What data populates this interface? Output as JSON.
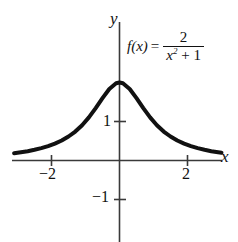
{
  "figure": {
    "kind": "function-graph",
    "background_color": "#ffffff",
    "curve_color": "#111111",
    "axis_color": "#3a3a3a"
  },
  "formula": {
    "function_name": "f(x)",
    "equals": "=",
    "numerator": "2",
    "denominator_variable": "x",
    "denominator_exponent": "2",
    "denominator_rest": "+ 1",
    "plain": "f(x) = 2 / (x^2 + 1)"
  },
  "axes": {
    "x_label": "x",
    "y_label": "y",
    "x_ticks": [
      {
        "value": -2,
        "label": "−2"
      },
      {
        "value": 2,
        "label": "2"
      }
    ],
    "y_ticks": [
      {
        "value": 1,
        "label": "1"
      },
      {
        "value": -1,
        "label": "−1"
      }
    ]
  },
  "chart_data": {
    "type": "line",
    "title": "",
    "subtitle": "",
    "xlabel": "x",
    "ylabel": "y",
    "xlim": [
      -3.1,
      3.0
    ],
    "ylim": [
      -2.1,
      2.6
    ],
    "xticks": [
      -2,
      2
    ],
    "xticklabels": [
      "−2",
      "2"
    ],
    "yticks": [
      1,
      -1
    ],
    "yticklabels": [
      "1",
      "−1"
    ],
    "grid": false,
    "legend": "none",
    "annotations": [
      "f(x) = 2/(x² + 1)"
    ],
    "series": [
      {
        "name": "f(x) = 2/(x^2 + 1)",
        "equation": "2/(x^2+1)",
        "color": "#111111",
        "linewidth": 4,
        "x": [
          -3.1,
          -2.9,
          -2.7,
          -2.5,
          -2.3,
          -2.1,
          -1.9,
          -1.7,
          -1.5,
          -1.3,
          -1.1,
          -0.9,
          -0.7,
          -0.5,
          -0.3,
          -0.1,
          0.0,
          0.1,
          0.3,
          0.5,
          0.7,
          0.9,
          1.1,
          1.3,
          1.5,
          1.7,
          1.9,
          2.1,
          2.3,
          2.5,
          2.7,
          2.9,
          3.0
        ],
        "y": [
          0.188,
          0.212,
          0.239,
          0.274,
          0.316,
          0.368,
          0.432,
          0.512,
          0.615,
          0.743,
          0.905,
          1.105,
          1.342,
          1.6,
          1.835,
          1.98,
          2.0,
          1.98,
          1.835,
          1.6,
          1.342,
          1.105,
          0.905,
          0.743,
          0.615,
          0.512,
          0.432,
          0.368,
          0.316,
          0.274,
          0.239,
          0.212,
          0.2
        ]
      }
    ]
  }
}
